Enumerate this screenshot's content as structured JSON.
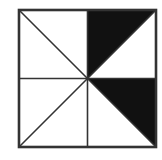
{
  "diagram": {
    "colors": {
      "background": "#ffffff",
      "stroke": "#333333",
      "fill": "#111111"
    },
    "square": {
      "x": 19,
      "y": 10,
      "size": 137
    },
    "center": {
      "x": 87.5,
      "y": 78.5
    },
    "shaded_triangles": [
      {
        "name": "top-right-upper",
        "points": "87.5,10 156,10 87.5,78.5"
      },
      {
        "name": "bottom-right-upper",
        "points": "87.5,78.5 156,78.5 156,147"
      }
    ],
    "lines": [
      {
        "name": "vertical-midline",
        "x1": 87.5,
        "y1": 10,
        "x2": 87.5,
        "y2": 147
      },
      {
        "name": "horizontal-midline",
        "x1": 19,
        "y1": 78.5,
        "x2": 156,
        "y2": 78.5
      },
      {
        "name": "diagonal-top-left",
        "x1": 19,
        "y1": 10,
        "x2": 87.5,
        "y2": 78.5
      },
      {
        "name": "diagonal-top-right",
        "x1": 87.5,
        "y1": 78.5,
        "x2": 156,
        "y2": 10
      },
      {
        "name": "diagonal-bottom-left",
        "x1": 87.5,
        "y1": 78.5,
        "x2": 19,
        "y2": 147
      },
      {
        "name": "diagonal-bottom-right",
        "x1": 87.5,
        "y1": 78.5,
        "x2": 156,
        "y2": 147
      }
    ]
  }
}
